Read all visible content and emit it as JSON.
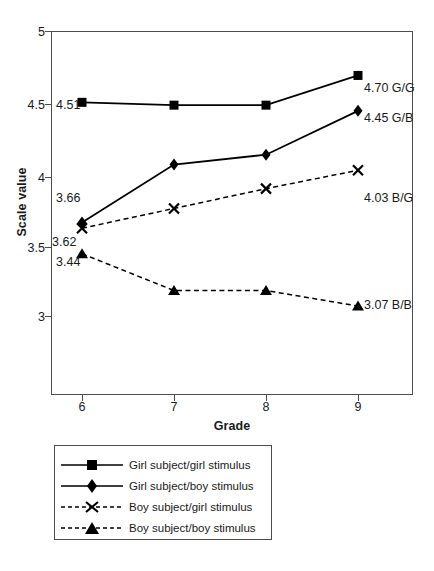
{
  "chart_data": {
    "type": "line",
    "title": "",
    "xlabel": "Grade",
    "ylabel": "Scale value",
    "categories": [
      "6",
      "7",
      "8",
      "9"
    ],
    "x": [
      6,
      7,
      8,
      9
    ],
    "xlim": [
      5.6,
      9.4
    ],
    "ylim": [
      2.55,
      5.0
    ],
    "yticks": [
      "3",
      "3.5",
      "4",
      "4.5",
      "5"
    ],
    "ytick_values": [
      3,
      3.5,
      4,
      4.5,
      5
    ],
    "grid": false,
    "legend_position": "below-plot",
    "series": [
      {
        "name": "Girl subject/girl stimulus",
        "code": "G/G",
        "marker": "square",
        "line": "solid",
        "values": [
          4.51,
          4.49,
          4.49,
          4.7
        ],
        "start_label": "4.51",
        "end_label": "4.70 G/G"
      },
      {
        "name": "Girl subject/boy stimulus",
        "code": "G/B",
        "marker": "diamond",
        "line": "solid",
        "values": [
          3.66,
          4.07,
          4.14,
          4.45
        ],
        "start_label": "3.66",
        "end_label": "4.45 G/B"
      },
      {
        "name": "Boy subject/girl stimulus",
        "code": "B/G",
        "marker": "cross",
        "line": "dashed",
        "values": [
          3.62,
          3.76,
          3.9,
          4.03
        ],
        "start_label": "3.62",
        "end_label": "4.03 B/G"
      },
      {
        "name": "Boy subject/boy stimulus",
        "code": "B/B",
        "marker": "triangle",
        "line": "dashed",
        "values": [
          3.44,
          3.18,
          3.18,
          3.07
        ],
        "start_label": "3.44",
        "end_label": "3.07 B/B"
      }
    ],
    "colors": {
      "line": "#000000",
      "axis": "#4d4d4d",
      "text": "#1a1a1a",
      "background": "#ffffff"
    }
  },
  "axes": {
    "y_title": "Scale value",
    "x_title": "Grade",
    "y_ticks": [
      "5",
      "4.5",
      "4",
      "3.5",
      "3"
    ],
    "x_ticks": [
      "6",
      "7",
      "8",
      "9"
    ]
  },
  "legend": {
    "items": [
      {
        "label": "Girl subject/girl stimulus"
      },
      {
        "label": "Girl subject/boy stimulus"
      },
      {
        "label": "Boy subject/girl stimulus"
      },
      {
        "label": "Boy subject/boy stimulus"
      }
    ]
  },
  "point_labels": {
    "gg_start": "4.51",
    "gg_end": "4.70 G/G",
    "gb_start": "3.66",
    "gb_end": "4.45 G/B",
    "bg_start": "3.62",
    "bg_end": "4.03 B/G",
    "bb_start": "3.44",
    "bb_end": "3.07 B/B"
  }
}
